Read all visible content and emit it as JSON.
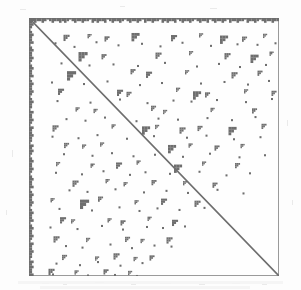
{
  "figure": {
    "kind": "spy-plot",
    "caption": "",
    "title": "",
    "accent_color": "#6e6e6e",
    "frame_color": "#9a9a9a",
    "background_color": "#fefefe",
    "page_color": "#fdfdfd"
  },
  "chart_data": {
    "type": "scatter",
    "title": "",
    "subtitle": "",
    "xlabel": "",
    "ylabel": "",
    "xlim": [
      0,
      100
    ],
    "ylim": [
      0,
      100
    ],
    "grid": false,
    "legend_position": "none",
    "annotations": [],
    "description": "Sparsity pattern (spy plot) of a square sparse matrix: full main diagonal, dense first rows and first columns, and scattered small dense blocks concentrated above the diagonal.",
    "marker": {
      "shape": "square",
      "color": "#6e6e6e",
      "size_px": 2
    },
    "structures": [
      {
        "name": "main-diagonal",
        "type": "line",
        "x": [
          0,
          100
        ],
        "y": [
          0,
          100
        ],
        "stroke_width_px": 1.6,
        "color": "#6e6e6e"
      },
      {
        "name": "dense-top-rows",
        "type": "band",
        "orientation": "horizontal",
        "start": 0,
        "thickness_pct": 1.6,
        "jagged": true,
        "color": "#6e6e6e"
      },
      {
        "name": "dense-left-columns",
        "type": "band",
        "orientation": "vertical",
        "start": 0,
        "thickness_pct": 1.6,
        "jagged": true,
        "color": "#6e6e6e"
      }
    ],
    "top_band_profile": [
      3,
      2,
      3,
      2,
      2,
      3,
      2,
      1,
      2,
      3,
      2,
      2,
      3,
      2,
      3,
      2,
      1,
      2,
      3,
      2,
      2,
      3,
      2,
      2,
      1,
      3,
      2,
      3,
      2,
      2,
      3,
      1,
      2,
      3,
      2,
      2,
      3,
      2,
      1,
      2,
      3,
      2,
      2,
      3,
      2,
      1,
      3,
      2,
      2,
      3,
      2,
      2,
      1,
      3,
      2,
      3,
      2,
      2,
      3,
      1,
      2,
      3,
      2,
      2,
      3,
      2,
      1,
      2,
      3,
      2,
      2,
      3,
      1,
      2,
      3,
      2,
      2,
      3,
      2,
      1,
      3,
      2,
      2,
      3,
      2,
      2,
      1,
      3,
      2,
      2,
      3,
      2,
      1,
      2,
      3,
      2,
      2,
      3,
      2,
      2
    ],
    "left_band_profile": [
      3,
      2,
      3,
      2,
      1,
      2,
      3,
      2,
      2,
      3,
      1,
      2,
      3,
      2,
      2,
      3,
      2,
      1,
      2,
      3,
      2,
      2,
      3,
      1,
      2,
      3,
      2,
      2,
      3,
      2,
      1,
      2,
      3,
      2,
      2,
      1,
      3,
      2,
      2,
      3,
      2,
      1,
      3,
      2,
      2,
      3,
      2,
      2,
      1,
      3,
      2,
      3,
      2,
      1,
      2,
      3,
      2,
      2,
      3,
      2,
      1,
      2,
      3,
      2,
      2,
      3,
      1,
      2,
      3,
      2,
      2,
      3,
      2,
      1,
      2,
      3,
      2,
      2,
      3,
      1,
      2,
      3,
      2,
      2,
      3,
      2,
      1,
      3,
      2,
      2,
      3,
      2,
      2,
      1,
      3,
      2,
      3,
      2,
      2,
      3
    ],
    "blocks": [
      {
        "x": 13.8,
        "y": 6.5,
        "w": 2.4,
        "h": 2.4
      },
      {
        "x": 23.4,
        "y": 6.2,
        "w": 1.6,
        "h": 1.6
      },
      {
        "x": 30.2,
        "y": 7.1,
        "w": 2.0,
        "h": 2.0
      },
      {
        "x": 41.0,
        "y": 5.8,
        "w": 3.2,
        "h": 3.2
      },
      {
        "x": 56.8,
        "y": 6.6,
        "w": 2.4,
        "h": 2.4
      },
      {
        "x": 68.0,
        "y": 5.9,
        "w": 1.6,
        "h": 1.6
      },
      {
        "x": 76.4,
        "y": 6.8,
        "w": 3.2,
        "h": 3.2
      },
      {
        "x": 85.2,
        "y": 7.2,
        "w": 2.0,
        "h": 2.0
      },
      {
        "x": 93.6,
        "y": 6.1,
        "w": 1.6,
        "h": 1.6
      },
      {
        "x": 19.8,
        "y": 13.2,
        "w": 3.6,
        "h": 3.6
      },
      {
        "x": 29.0,
        "y": 14.0,
        "w": 2.0,
        "h": 2.0
      },
      {
        "x": 50.6,
        "y": 13.4,
        "w": 2.4,
        "h": 2.4
      },
      {
        "x": 64.0,
        "y": 12.8,
        "w": 1.6,
        "h": 1.6
      },
      {
        "x": 78.2,
        "y": 13.6,
        "w": 2.4,
        "h": 2.4
      },
      {
        "x": 88.6,
        "y": 14.2,
        "w": 3.2,
        "h": 3.2
      },
      {
        "x": 96.2,
        "y": 13.0,
        "w": 1.6,
        "h": 1.6
      },
      {
        "x": 15.2,
        "y": 20.6,
        "w": 3.6,
        "h": 3.6
      },
      {
        "x": 40.6,
        "y": 19.8,
        "w": 2.0,
        "h": 2.0
      },
      {
        "x": 46.8,
        "y": 20.8,
        "w": 2.4,
        "h": 2.4
      },
      {
        "x": 62.4,
        "y": 20.2,
        "w": 1.6,
        "h": 1.6
      },
      {
        "x": 81.0,
        "y": 21.0,
        "w": 2.4,
        "h": 2.4
      },
      {
        "x": 91.4,
        "y": 20.4,
        "w": 2.0,
        "h": 2.0
      },
      {
        "x": 11.6,
        "y": 27.4,
        "w": 2.4,
        "h": 2.4
      },
      {
        "x": 35.2,
        "y": 27.8,
        "w": 2.4,
        "h": 2.4
      },
      {
        "x": 39.0,
        "y": 28.6,
        "w": 2.0,
        "h": 2.0
      },
      {
        "x": 58.8,
        "y": 27.0,
        "w": 1.6,
        "h": 1.6
      },
      {
        "x": 65.6,
        "y": 28.4,
        "w": 3.2,
        "h": 3.2
      },
      {
        "x": 70.4,
        "y": 28.8,
        "w": 2.0,
        "h": 2.0
      },
      {
        "x": 86.0,
        "y": 27.6,
        "w": 1.6,
        "h": 1.6
      },
      {
        "x": 97.0,
        "y": 28.2,
        "w": 2.0,
        "h": 2.0
      },
      {
        "x": 18.6,
        "y": 34.6,
        "w": 1.6,
        "h": 1.6
      },
      {
        "x": 25.8,
        "y": 35.2,
        "w": 1.6,
        "h": 1.6
      },
      {
        "x": 48.8,
        "y": 34.0,
        "w": 2.0,
        "h": 2.0
      },
      {
        "x": 53.6,
        "y": 35.6,
        "w": 1.6,
        "h": 1.6
      },
      {
        "x": 72.6,
        "y": 34.8,
        "w": 1.6,
        "h": 1.6
      },
      {
        "x": 89.2,
        "y": 35.0,
        "w": 2.0,
        "h": 2.0
      },
      {
        "x": 9.4,
        "y": 41.6,
        "w": 2.4,
        "h": 2.4
      },
      {
        "x": 33.0,
        "y": 41.2,
        "w": 1.6,
        "h": 1.6
      },
      {
        "x": 45.2,
        "y": 42.0,
        "w": 3.2,
        "h": 3.2
      },
      {
        "x": 50.4,
        "y": 41.4,
        "w": 1.6,
        "h": 1.6
      },
      {
        "x": 60.2,
        "y": 42.4,
        "w": 2.4,
        "h": 2.4
      },
      {
        "x": 67.4,
        "y": 41.8,
        "w": 2.0,
        "h": 2.0
      },
      {
        "x": 79.8,
        "y": 42.2,
        "w": 3.2,
        "h": 3.2
      },
      {
        "x": 93.0,
        "y": 41.0,
        "w": 2.0,
        "h": 2.0
      },
      {
        "x": 14.0,
        "y": 48.4,
        "w": 2.0,
        "h": 2.0
      },
      {
        "x": 21.2,
        "y": 49.0,
        "w": 1.6,
        "h": 1.6
      },
      {
        "x": 28.4,
        "y": 48.2,
        "w": 1.6,
        "h": 1.6
      },
      {
        "x": 55.6,
        "y": 49.2,
        "w": 3.2,
        "h": 3.2
      },
      {
        "x": 63.8,
        "y": 48.6,
        "w": 1.6,
        "h": 1.6
      },
      {
        "x": 74.2,
        "y": 49.4,
        "w": 2.0,
        "h": 2.0
      },
      {
        "x": 84.6,
        "y": 48.8,
        "w": 1.6,
        "h": 1.6
      },
      {
        "x": 10.8,
        "y": 55.8,
        "w": 1.6,
        "h": 1.6
      },
      {
        "x": 24.6,
        "y": 56.4,
        "w": 1.6,
        "h": 1.6
      },
      {
        "x": 34.8,
        "y": 56.0,
        "w": 2.4,
        "h": 2.4
      },
      {
        "x": 43.0,
        "y": 55.2,
        "w": 1.6,
        "h": 1.6
      },
      {
        "x": 58.0,
        "y": 56.8,
        "w": 3.2,
        "h": 3.2
      },
      {
        "x": 69.2,
        "y": 55.6,
        "w": 1.6,
        "h": 1.6
      },
      {
        "x": 82.4,
        "y": 56.2,
        "w": 2.0,
        "h": 2.0
      },
      {
        "x": 17.4,
        "y": 63.0,
        "w": 2.4,
        "h": 2.4
      },
      {
        "x": 30.6,
        "y": 62.4,
        "w": 1.6,
        "h": 1.6
      },
      {
        "x": 37.8,
        "y": 63.6,
        "w": 1.6,
        "h": 1.6
      },
      {
        "x": 49.0,
        "y": 62.8,
        "w": 2.0,
        "h": 2.0
      },
      {
        "x": 61.6,
        "y": 63.2,
        "w": 1.6,
        "h": 1.6
      },
      {
        "x": 73.4,
        "y": 63.8,
        "w": 2.0,
        "h": 2.0
      },
      {
        "x": 8.6,
        "y": 69.8,
        "w": 1.6,
        "h": 1.6
      },
      {
        "x": 20.4,
        "y": 70.4,
        "w": 3.6,
        "h": 3.6
      },
      {
        "x": 27.6,
        "y": 69.2,
        "w": 2.0,
        "h": 2.0
      },
      {
        "x": 42.2,
        "y": 70.6,
        "w": 1.6,
        "h": 1.6
      },
      {
        "x": 52.8,
        "y": 70.0,
        "w": 2.4,
        "h": 2.4
      },
      {
        "x": 66.2,
        "y": 70.8,
        "w": 2.4,
        "h": 2.4
      },
      {
        "x": 12.4,
        "y": 77.2,
        "w": 2.4,
        "h": 2.4
      },
      {
        "x": 16.8,
        "y": 78.0,
        "w": 1.6,
        "h": 1.6
      },
      {
        "x": 31.4,
        "y": 77.6,
        "w": 1.6,
        "h": 1.6
      },
      {
        "x": 36.6,
        "y": 78.4,
        "w": 2.0,
        "h": 2.0
      },
      {
        "x": 47.4,
        "y": 77.0,
        "w": 1.6,
        "h": 1.6
      },
      {
        "x": 57.2,
        "y": 78.2,
        "w": 2.4,
        "h": 2.4
      },
      {
        "x": 9.8,
        "y": 84.6,
        "w": 2.4,
        "h": 2.4
      },
      {
        "x": 22.8,
        "y": 85.2,
        "w": 1.6,
        "h": 1.6
      },
      {
        "x": 38.4,
        "y": 84.8,
        "w": 2.0,
        "h": 2.0
      },
      {
        "x": 44.6,
        "y": 85.6,
        "w": 1.6,
        "h": 1.6
      },
      {
        "x": 55.0,
        "y": 85.0,
        "w": 2.4,
        "h": 2.4
      },
      {
        "x": 13.2,
        "y": 91.8,
        "w": 2.0,
        "h": 2.0
      },
      {
        "x": 26.4,
        "y": 92.4,
        "w": 1.6,
        "h": 1.6
      },
      {
        "x": 33.8,
        "y": 91.2,
        "w": 2.4,
        "h": 2.4
      },
      {
        "x": 41.8,
        "y": 92.6,
        "w": 1.6,
        "h": 1.6
      },
      {
        "x": 48.2,
        "y": 92.0,
        "w": 2.0,
        "h": 2.0
      },
      {
        "x": 7.8,
        "y": 97.2,
        "w": 2.4,
        "h": 2.4
      },
      {
        "x": 18.2,
        "y": 97.8,
        "w": 1.6,
        "h": 1.6
      },
      {
        "x": 29.8,
        "y": 97.4,
        "w": 2.0,
        "h": 2.0
      },
      {
        "x": 39.6,
        "y": 98.0,
        "w": 1.6,
        "h": 1.6
      }
    ],
    "dots": [
      {
        "x": 10.2,
        "y": 9.4
      },
      {
        "x": 17.8,
        "y": 10.8
      },
      {
        "x": 26.6,
        "y": 9.0
      },
      {
        "x": 35.4,
        "y": 10.2
      },
      {
        "x": 44.8,
        "y": 9.6
      },
      {
        "x": 52.2,
        "y": 10.6
      },
      {
        "x": 61.0,
        "y": 9.2
      },
      {
        "x": 72.4,
        "y": 10.4
      },
      {
        "x": 83.0,
        "y": 9.8
      },
      {
        "x": 91.0,
        "y": 10.0
      },
      {
        "x": 98.2,
        "y": 9.4
      },
      {
        "x": 12.6,
        "y": 17.2
      },
      {
        "x": 23.8,
        "y": 18.0
      },
      {
        "x": 33.4,
        "y": 17.6
      },
      {
        "x": 43.2,
        "y": 18.2
      },
      {
        "x": 54.0,
        "y": 17.0
      },
      {
        "x": 66.8,
        "y": 18.4
      },
      {
        "x": 75.6,
        "y": 17.4
      },
      {
        "x": 84.0,
        "y": 18.6
      },
      {
        "x": 94.4,
        "y": 17.8
      },
      {
        "x": 8.8,
        "y": 24.6
      },
      {
        "x": 21.6,
        "y": 25.2
      },
      {
        "x": 31.0,
        "y": 24.2
      },
      {
        "x": 44.0,
        "y": 25.6
      },
      {
        "x": 52.8,
        "y": 24.8
      },
      {
        "x": 68.4,
        "y": 25.0
      },
      {
        "x": 77.8,
        "y": 24.4
      },
      {
        "x": 87.2,
        "y": 25.4
      },
      {
        "x": 95.6,
        "y": 24.0
      },
      {
        "x": 11.0,
        "y": 31.8
      },
      {
        "x": 24.2,
        "y": 32.4
      },
      {
        "x": 36.0,
        "y": 31.2
      },
      {
        "x": 47.0,
        "y": 32.6
      },
      {
        "x": 57.4,
        "y": 31.6
      },
      {
        "x": 64.6,
        "y": 32.0
      },
      {
        "x": 74.8,
        "y": 31.4
      },
      {
        "x": 86.4,
        "y": 32.2
      },
      {
        "x": 96.8,
        "y": 31.0
      },
      {
        "x": 14.6,
        "y": 38.8
      },
      {
        "x": 22.2,
        "y": 39.4
      },
      {
        "x": 30.0,
        "y": 38.2
      },
      {
        "x": 42.6,
        "y": 39.6
      },
      {
        "x": 51.4,
        "y": 38.6
      },
      {
        "x": 59.2,
        "y": 39.0
      },
      {
        "x": 71.0,
        "y": 38.4
      },
      {
        "x": 80.8,
        "y": 39.2
      },
      {
        "x": 90.2,
        "y": 38.0
      },
      {
        "x": 9.0,
        "y": 45.6
      },
      {
        "x": 19.4,
        "y": 46.2
      },
      {
        "x": 27.0,
        "y": 45.0
      },
      {
        "x": 38.8,
        "y": 46.4
      },
      {
        "x": 49.6,
        "y": 45.4
      },
      {
        "x": 62.8,
        "y": 46.0
      },
      {
        "x": 70.6,
        "y": 45.2
      },
      {
        "x": 81.6,
        "y": 46.6
      },
      {
        "x": 92.2,
        "y": 45.8
      },
      {
        "x": 13.6,
        "y": 52.4
      },
      {
        "x": 25.0,
        "y": 53.0
      },
      {
        "x": 32.8,
        "y": 52.0
      },
      {
        "x": 41.4,
        "y": 53.2
      },
      {
        "x": 50.0,
        "y": 52.6
      },
      {
        "x": 61.2,
        "y": 53.4
      },
      {
        "x": 72.0,
        "y": 52.2
      },
      {
        "x": 83.8,
        "y": 53.6
      },
      {
        "x": 94.0,
        "y": 52.8
      },
      {
        "x": 10.4,
        "y": 59.6
      },
      {
        "x": 20.8,
        "y": 60.2
      },
      {
        "x": 29.4,
        "y": 59.0
      },
      {
        "x": 40.0,
        "y": 60.4
      },
      {
        "x": 46.2,
        "y": 59.4
      },
      {
        "x": 56.0,
        "y": 60.0
      },
      {
        "x": 67.8,
        "y": 59.2
      },
      {
        "x": 78.6,
        "y": 60.6
      },
      {
        "x": 88.0,
        "y": 59.8
      },
      {
        "x": 15.8,
        "y": 66.4
      },
      {
        "x": 23.0,
        "y": 67.0
      },
      {
        "x": 34.2,
        "y": 66.0
      },
      {
        "x": 45.6,
        "y": 67.2
      },
      {
        "x": 54.6,
        "y": 66.6
      },
      {
        "x": 63.2,
        "y": 67.4
      },
      {
        "x": 75.0,
        "y": 66.2
      },
      {
        "x": 85.4,
        "y": 67.6
      },
      {
        "x": 11.8,
        "y": 73.6
      },
      {
        "x": 24.8,
        "y": 74.2
      },
      {
        "x": 35.8,
        "y": 73.0
      },
      {
        "x": 43.8,
        "y": 74.4
      },
      {
        "x": 51.0,
        "y": 73.4
      },
      {
        "x": 59.8,
        "y": 74.0
      },
      {
        "x": 69.8,
        "y": 73.2
      },
      {
        "x": 8.2,
        "y": 80.8
      },
      {
        "x": 19.0,
        "y": 81.4
      },
      {
        "x": 28.8,
        "y": 80.2
      },
      {
        "x": 37.2,
        "y": 81.6
      },
      {
        "x": 46.8,
        "y": 80.6
      },
      {
        "x": 53.2,
        "y": 81.0
      },
      {
        "x": 62.0,
        "y": 80.4
      },
      {
        "x": 14.4,
        "y": 88.0
      },
      {
        "x": 21.0,
        "y": 88.6
      },
      {
        "x": 32.2,
        "y": 87.4
      },
      {
        "x": 40.8,
        "y": 88.8
      },
      {
        "x": 49.8,
        "y": 87.8
      },
      {
        "x": 56.6,
        "y": 88.2
      },
      {
        "x": 10.6,
        "y": 94.8
      },
      {
        "x": 20.0,
        "y": 95.4
      },
      {
        "x": 27.2,
        "y": 94.2
      },
      {
        "x": 36.2,
        "y": 95.6
      },
      {
        "x": 45.0,
        "y": 94.6
      },
      {
        "x": 9.2,
        "y": 99.0
      },
      {
        "x": 23.2,
        "y": 99.4
      },
      {
        "x": 34.0,
        "y": 99.2
      },
      {
        "x": 42.8,
        "y": 99.6
      }
    ]
  }
}
